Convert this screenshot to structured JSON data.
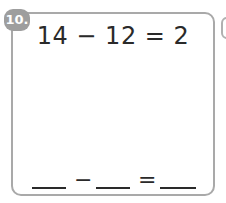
{
  "problem": {
    "number": "10.",
    "equation": "14 − 12 = 2",
    "answer_template": {
      "operator": "−",
      "equals": "=",
      "blanks": [
        "",
        "",
        ""
      ]
    }
  },
  "colors": {
    "badge": "#9e9e9e",
    "border": "#a9a9a9",
    "text": "#2a2a2a"
  }
}
